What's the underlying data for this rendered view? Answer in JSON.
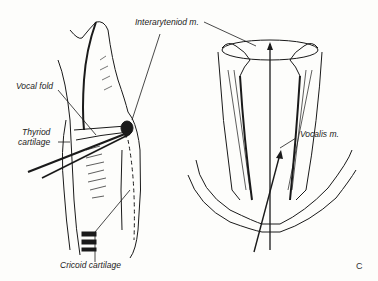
{
  "figure": {
    "panel_letter": "C",
    "views": [
      "lateral-larynx",
      "posterior-laryngeal-muscles"
    ]
  },
  "labels": {
    "interarytenoid": "Interaryteniod m.",
    "vocal_fold": "Vocal fold",
    "thyroid_line1": "Thyriod",
    "thyroid_line2": "cartilage",
    "vocalis": "Vocalis m.",
    "cricoid": "Cricoid cartilage"
  },
  "colors": {
    "ink": "#1a1a1a",
    "paper": "#fdfdfb"
  }
}
